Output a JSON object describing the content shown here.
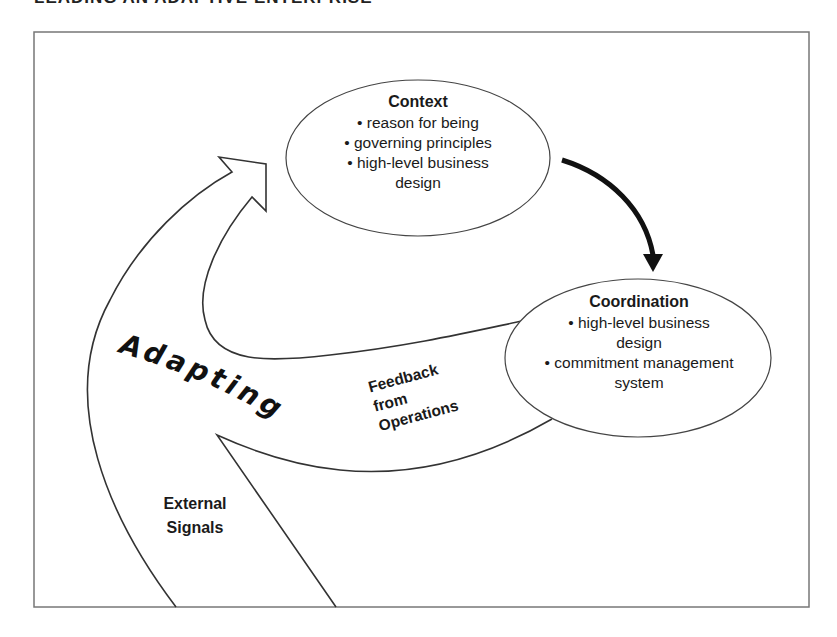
{
  "header": {
    "title": "LEADING AN ADAPTIVE ENTERPRISE"
  },
  "diagram": {
    "context": {
      "title": "Context",
      "items": [
        "• reason for being",
        "• governing principles",
        "• high-level business",
        "design"
      ]
    },
    "coordination": {
      "title": "Coordination",
      "items": [
        "• high-level business",
        "design",
        "• commitment management",
        "system"
      ]
    },
    "adapting_label": "Adapting",
    "feedback_label": [
      "Feedback",
      "from",
      "Operations"
    ],
    "external_label": [
      "External",
      "Signals"
    ]
  },
  "colors": {
    "line": "#333333",
    "frame": "#777777",
    "text": "#1a1a1a",
    "background": "#ffffff"
  }
}
